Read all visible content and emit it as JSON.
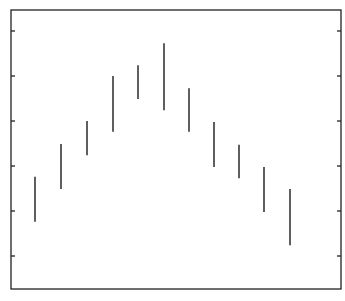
{
  "chart_data": {
    "type": "range-bar",
    "title": "",
    "xlabel": "",
    "ylabel": "",
    "categories": [
      "1",
      "2",
      "3",
      "4",
      "5",
      "6",
      "7",
      "8",
      "9",
      "10",
      "11"
    ],
    "series": [
      {
        "name": "range",
        "low": [
          1.76,
          2.49,
          3.24,
          3.76,
          4.49,
          4.24,
          3.76,
          2.98,
          2.73,
          1.98,
          1.24
        ],
        "high": [
          2.76,
          3.49,
          4.0,
          5.0,
          5.24,
          5.73,
          4.73,
          3.98,
          3.47,
          2.98,
          2.49
        ]
      }
    ],
    "yticks": [
      1,
      2,
      3,
      4,
      5,
      6
    ],
    "ytick_labels": [],
    "xticks": [],
    "ylim": [
      0.27,
      6.47
    ],
    "grid": false,
    "legend": null,
    "ticks_both_sides": true
  },
  "layout": {
    "plot_left": 11,
    "plot_right": 341,
    "plot_top": 10,
    "plot_bottom": 289,
    "bar_x": [
      35,
      61,
      87,
      113,
      138,
      164,
      189,
      214,
      239,
      264,
      290
    ],
    "tick_unit_px": 45,
    "tick_ref_value": 1,
    "tick_ref_y": 256,
    "axis_color": "#222222",
    "bar_color": "#1a1a1a"
  }
}
